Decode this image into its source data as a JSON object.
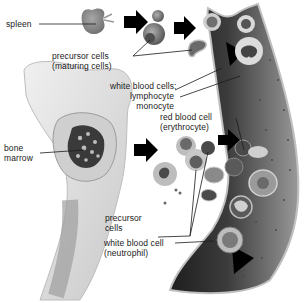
{
  "diagram": {
    "labels": {
      "spleen": "spleen",
      "precursor_maturing_line1": "precursor cells",
      "precursor_maturing_line2": "(maturing cells)",
      "wbc_heading": "white blood cells:",
      "lymphocyte": "lymphocyte",
      "monocyte": "monocyte",
      "rbc_line1": "red blood cell",
      "rbc_line2": "(erythrocyte)",
      "bone_marrow_line1": "bone",
      "bone_marrow_line2": "marrow",
      "precursor_line1": "precursor",
      "precursor_line2": "cells",
      "neutrophil_line1": "white blood cell",
      "neutrophil_line2": "(neutrophil)"
    },
    "colors": {
      "vessel_dark": "#2e2e2e",
      "vessel_mid": "#6a6a6a",
      "vessel_wall": "#bdbdbd",
      "organ_gray": "#8a8a8a",
      "bone_light": "#d9d9d9",
      "arrow": "#000000",
      "text": "#1a1a1a"
    }
  }
}
